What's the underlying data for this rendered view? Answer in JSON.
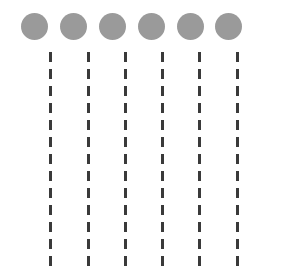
{
  "figure": {
    "background_color": "#ffffff",
    "width": 283,
    "height": 269
  },
  "dots": {
    "count": 6,
    "color": "#9a9a9a",
    "diameter": 27,
    "center_y": 26,
    "centers_x": [
      34,
      73,
      112,
      151,
      190,
      228
    ],
    "label": "gray-circle"
  },
  "dashed_lines": {
    "count": 6,
    "color": "#3a3a3a",
    "line_width": 3,
    "dash_length": 10,
    "gap_length": 7,
    "start_y": 52,
    "end_y": 264,
    "positions_x": [
      50,
      88,
      125,
      162,
      199,
      237
    ],
    "label": "vertical-dashed-line"
  }
}
